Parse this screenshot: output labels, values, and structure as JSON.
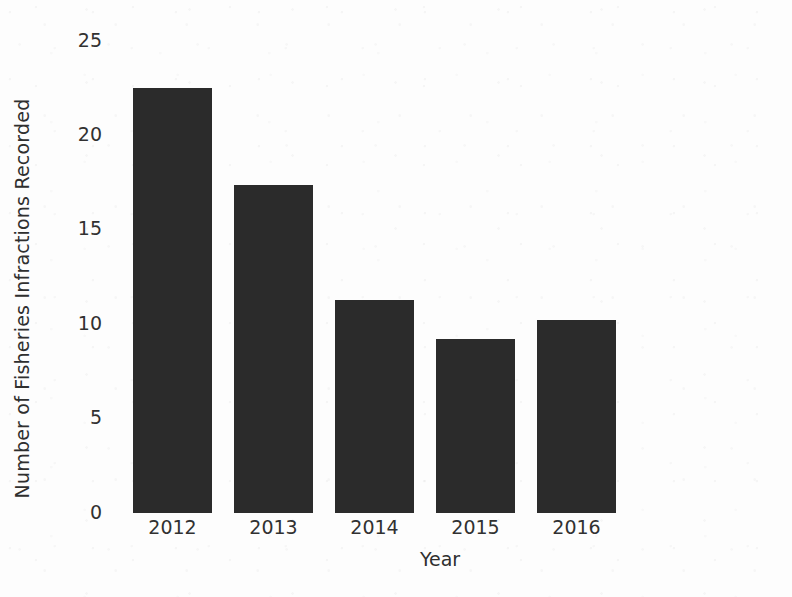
{
  "chart_data": {
    "type": "bar",
    "title": "",
    "subtitle": "",
    "xlabel": "Year",
    "ylabel": "Number of Fisheries Infractions Recorded",
    "categories": [
      "2012",
      "2013",
      "2014",
      "2015",
      "2016"
    ],
    "values": [
      22,
      17,
      11,
      9,
      10
    ],
    "series": [
      {
        "name": "Fisheries Infractions Recorded",
        "values": [
          22,
          17,
          11,
          9,
          10
        ]
      }
    ],
    "ylim": [
      0,
      25
    ],
    "yticks": [
      0,
      5,
      10,
      15,
      20,
      25
    ],
    "ytick_labels": [
      "0",
      "5",
      "10",
      "15",
      "20",
      "25"
    ],
    "grid": false,
    "legend": false,
    "legend_position": "none",
    "annotations": [],
    "bar_color": "#2b2b2b",
    "background_color": "#fdfdfd",
    "text_color": "#313131"
  }
}
